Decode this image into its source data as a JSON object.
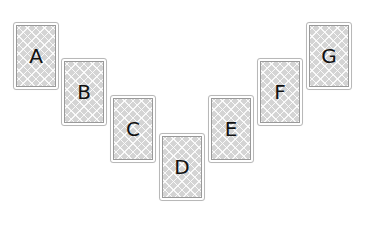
{
  "diagram": {
    "layout": "V-shaped arrangement of cards",
    "cards": [
      {
        "label": "A",
        "x": 13,
        "y": 22
      },
      {
        "label": "B",
        "x": 61,
        "y": 58
      },
      {
        "label": "C",
        "x": 110,
        "y": 95
      },
      {
        "label": "D",
        "x": 159,
        "y": 133
      },
      {
        "label": "E",
        "x": 208,
        "y": 95
      },
      {
        "label": "F",
        "x": 257,
        "y": 58
      },
      {
        "label": "G",
        "x": 306,
        "y": 22
      }
    ],
    "colors": {
      "card_border": "#b8b8b8",
      "face_fill": "#d4d4d4",
      "letter": "#111111"
    }
  }
}
